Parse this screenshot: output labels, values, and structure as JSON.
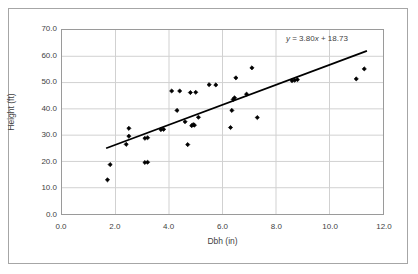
{
  "chart_data": {
    "type": "scatter",
    "title": "",
    "xlabel": "Dbh (in)",
    "ylabel": "Height (ft)",
    "xlim": [
      0.0,
      12.0
    ],
    "ylim": [
      0.0,
      70.0
    ],
    "xticks": [
      "0.0",
      "2.0",
      "4.0",
      "6.0",
      "8.0",
      "10.0",
      "12.0"
    ],
    "yticks": [
      "0.0",
      "10.0",
      "20.0",
      "30.0",
      "40.0",
      "50.0",
      "60.0",
      "70.0"
    ],
    "xtick_values": [
      0.0,
      2.0,
      4.0,
      6.0,
      8.0,
      10.0,
      12.0
    ],
    "ytick_values": [
      0.0,
      10.0,
      20.0,
      30.0,
      40.0,
      50.0,
      60.0,
      70.0
    ],
    "grid": "both",
    "legend": "none",
    "marker": "filled-diamond",
    "marker_color": "#000000",
    "series": [
      {
        "name": "Tree measurements",
        "points": [
          [
            1.7,
            13.0
          ],
          [
            1.8,
            18.8
          ],
          [
            2.4,
            26.5
          ],
          [
            2.5,
            32.6
          ],
          [
            2.5,
            29.6
          ],
          [
            3.1,
            28.8
          ],
          [
            3.1,
            19.6
          ],
          [
            3.2,
            29.0
          ],
          [
            3.2,
            19.7
          ],
          [
            3.7,
            32.1
          ],
          [
            3.8,
            32.2
          ],
          [
            4.1,
            46.8
          ],
          [
            4.3,
            39.4
          ],
          [
            4.4,
            46.8
          ],
          [
            4.6,
            35.1
          ],
          [
            4.7,
            26.4
          ],
          [
            4.8,
            46.2
          ],
          [
            4.85,
            33.6
          ],
          [
            4.9,
            34.0
          ],
          [
            4.95,
            33.8
          ],
          [
            5.0,
            46.3
          ],
          [
            5.1,
            36.8
          ],
          [
            5.5,
            49.2
          ],
          [
            5.75,
            49.1
          ],
          [
            6.3,
            32.9
          ],
          [
            6.35,
            39.4
          ],
          [
            6.4,
            43.6
          ],
          [
            6.45,
            44.2
          ],
          [
            6.5,
            51.8
          ],
          [
            6.9,
            45.6
          ],
          [
            7.1,
            55.6
          ],
          [
            7.3,
            36.7
          ],
          [
            8.6,
            50.7
          ],
          [
            8.7,
            50.9
          ],
          [
            8.8,
            51.1
          ],
          [
            11.0,
            51.4
          ],
          [
            11.3,
            55.2
          ]
        ]
      }
    ],
    "trendline": {
      "type": "linear",
      "slope": 3.8,
      "intercept": 18.73,
      "equation": "y = 3.80x + 18.73",
      "equation_parts": {
        "y": "y",
        "body": " = 3.80",
        "x": "x",
        "tail": " + 18.73"
      },
      "x_start": 1.65,
      "x_end": 11.4,
      "color": "#000000"
    }
  },
  "axes": {
    "x_title": "Dbh (in)",
    "y_title": "Height (ft)"
  }
}
